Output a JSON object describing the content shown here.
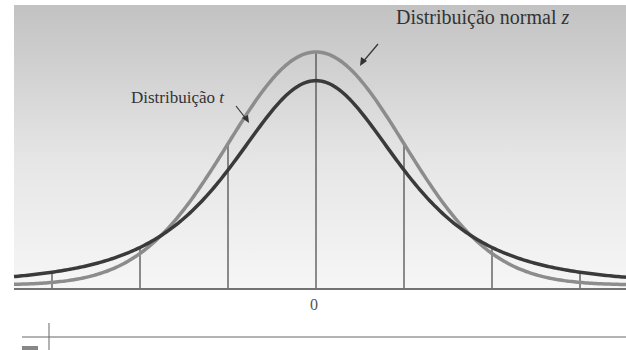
{
  "chart_data": {
    "type": "line",
    "title": "",
    "xlabel": "",
    "ylabel": "",
    "x_ticks": [
      "0"
    ],
    "grid": false,
    "series": [
      {
        "name": "Distribuição normal z",
        "distribution": "standard normal",
        "color": "#8a8a8a",
        "peak": 0.399
      },
      {
        "name": "Distribuição t",
        "distribution": "student t (low df)",
        "color": "#3a3a3a",
        "peak": 0.35
      }
    ],
    "vertical_lines_sd": [
      -3,
      -2,
      -1,
      0,
      1,
      2,
      3
    ],
    "xlim": [
      -3.4,
      3.4
    ],
    "annotations": [
      {
        "text": "Distribuição normal z",
        "points_to": "normal curve near peak"
      },
      {
        "text": "Distribuição t",
        "points_to": "t curve left shoulder"
      }
    ]
  },
  "labels": {
    "normal_main": "Distribuição normal ",
    "normal_var": "z",
    "t_main": "Distribuição ",
    "t_var": "t",
    "zero": "0"
  },
  "colors": {
    "background_top": "#c4c4c4",
    "background_bottom": "#f4f4f4",
    "normal_curve": "#8c8c8c",
    "t_curve": "#3a3a3a",
    "axis": "#444444"
  }
}
